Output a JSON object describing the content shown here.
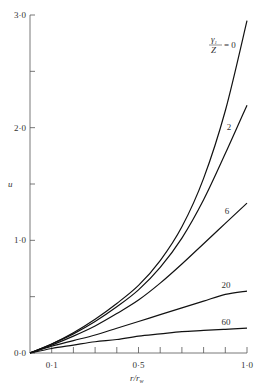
{
  "chart_data": {
    "type": "line",
    "title": "",
    "xlabel": "r/r_w",
    "ylabel": "u",
    "xlim": [
      0,
      1.0
    ],
    "ylim": [
      0,
      3.0
    ],
    "grid": false,
    "x_tick_labels": [
      "0·1",
      "0·5",
      "1·0"
    ],
    "x_tick_values": [
      0.1,
      0.5,
      1.0
    ],
    "x_minor_ticks": [
      0.1,
      0.2,
      0.3,
      0.4,
      0.5,
      0.6,
      0.7,
      0.8,
      0.9,
      1.0
    ],
    "y_tick_labels": [
      "0·0",
      "1·0",
      "2·0",
      "3·0"
    ],
    "y_tick_values": [
      0.0,
      1.0,
      2.0,
      3.0
    ],
    "y_minor_ticks": [
      0.5,
      1.5,
      2.5
    ],
    "legend_title": "γ1/Z",
    "x": [
      0,
      0.1,
      0.2,
      0.3,
      0.4,
      0.5,
      0.6,
      0.7,
      0.8,
      0.9,
      1.0
    ],
    "series": [
      {
        "name": "0",
        "label": "γ1/Z = 0",
        "values": [
          0,
          0.08,
          0.18,
          0.3,
          0.44,
          0.6,
          0.82,
          1.12,
          1.55,
          2.15,
          2.95
        ]
      },
      {
        "name": "2",
        "label": "2",
        "values": [
          0,
          0.08,
          0.17,
          0.28,
          0.41,
          0.56,
          0.76,
          1.02,
          1.36,
          1.77,
          2.2
        ]
      },
      {
        "name": "6",
        "label": "6",
        "values": [
          0,
          0.07,
          0.15,
          0.24,
          0.35,
          0.47,
          0.62,
          0.79,
          0.97,
          1.15,
          1.33
        ]
      },
      {
        "name": "20",
        "label": "20",
        "values": [
          0,
          0.06,
          0.11,
          0.16,
          0.22,
          0.28,
          0.34,
          0.4,
          0.46,
          0.52,
          0.55
        ]
      },
      {
        "name": "60",
        "label": "60",
        "values": [
          0,
          0.04,
          0.07,
          0.1,
          0.12,
          0.15,
          0.17,
          0.19,
          0.2,
          0.21,
          0.22
        ]
      }
    ]
  },
  "labels": {
    "y_axis": "u",
    "x_axis_r": "r",
    "x_axis_sub": "w",
    "legend_num": "γ",
    "legend_sub": "1",
    "legend_den": "Z",
    "legend_eq": "= 0"
  }
}
